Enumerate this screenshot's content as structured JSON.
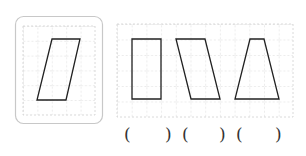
{
  "reference_panel": {
    "shape": "parallelogram",
    "border_color": "#c8c8c8"
  },
  "options_panel": {
    "shapes": [
      "rectangle",
      "parallelogram-slanted-right",
      "trapezoid"
    ]
  },
  "answers": {
    "blanks": [
      {
        "open": "(",
        "close": ")"
      },
      {
        "open": "(",
        "close": ")"
      },
      {
        "open": "(",
        "close": ")"
      }
    ]
  },
  "colors": {
    "grid": "#cfcfcf",
    "shape_stroke": "#222222"
  }
}
